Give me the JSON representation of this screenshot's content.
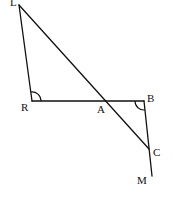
{
  "diagram": {
    "points": {
      "L": {
        "label": "L",
        "x": 19,
        "y": 5,
        "lx": 10,
        "ly": 6
      },
      "R": {
        "label": "R",
        "x": 32,
        "y": 101,
        "lx": 21,
        "ly": 111
      },
      "A": {
        "label": "A",
        "x": 105,
        "y": 101,
        "lx": 97,
        "ly": 113
      },
      "B": {
        "label": "B",
        "x": 144,
        "y": 101,
        "lx": 147,
        "ly": 102
      },
      "C": {
        "label": "C",
        "x": 149,
        "y": 149,
        "lx": 153,
        "ly": 156
      },
      "M": {
        "label": "M",
        "x": 152,
        "y": 176,
        "lx": 137,
        "ly": 184
      }
    },
    "segments": [
      {
        "from": "L",
        "to": "R"
      },
      {
        "from": "R",
        "to": "B"
      },
      {
        "from": "L",
        "to": "C"
      },
      {
        "from": "B",
        "to": "M"
      }
    ],
    "angle_marks": [
      {
        "vertex": "R",
        "between": [
          "L",
          "A"
        ]
      },
      {
        "vertex": "B",
        "between": [
          "A",
          "C"
        ]
      }
    ]
  }
}
